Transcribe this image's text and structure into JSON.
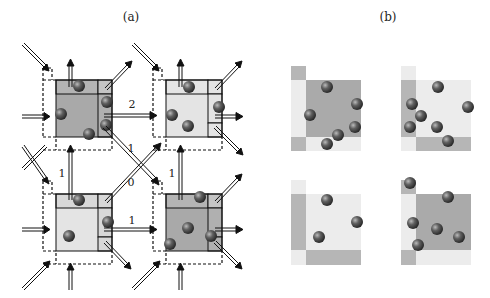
{
  "panels": {
    "a": {
      "label": "(a)"
    },
    "b": {
      "label": "(b)"
    }
  },
  "flow_labels": {
    "top_horizontal": "2",
    "diag_top": "1",
    "center": "0",
    "left_vertical": "1",
    "right_vertical": "1",
    "bottom_horizontal": "1"
  },
  "colors": {
    "dark_cell": "#a9a9a9",
    "light_cell": "#e4e4e4",
    "ball": "#555555",
    "line": "#111111"
  }
}
